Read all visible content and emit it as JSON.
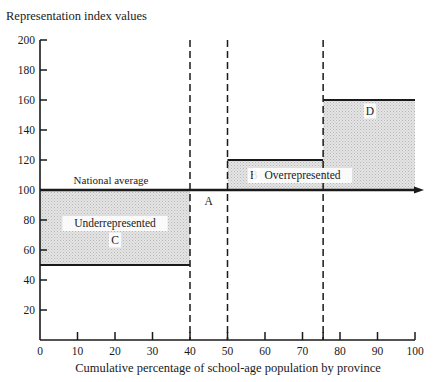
{
  "chart_data": {
    "type": "step-area",
    "title": "",
    "ylabel": "Representation index values",
    "xlabel": "Cumulative percentage of school-age population by province",
    "xlim": [
      0,
      100
    ],
    "ylim": [
      0,
      200
    ],
    "x_ticks": [
      0,
      10,
      20,
      30,
      40,
      50,
      60,
      70,
      80,
      90,
      100
    ],
    "y_ticks": [
      20,
      40,
      60,
      80,
      100,
      120,
      140,
      160,
      180,
      200
    ],
    "grid": false,
    "reference_line": {
      "label": "National average",
      "value": 100
    },
    "series": [
      {
        "name": "Representation index",
        "segments": [
          {
            "x_start": 0,
            "x_end": 40,
            "value": 50
          },
          {
            "x_start": 40,
            "x_end": 50,
            "value": 100
          },
          {
            "x_start": 50,
            "x_end": 75.5,
            "value": 120
          },
          {
            "x_start": 75.5,
            "x_end": 100,
            "value": 160
          }
        ]
      }
    ],
    "dashed_verticals": [
      40,
      50,
      75.5
    ],
    "annotations": [
      {
        "text": "Underrepresented",
        "x": 20,
        "y": 78
      },
      {
        "text": "C",
        "x": 20,
        "y": 67
      },
      {
        "text": "A",
        "x": 45,
        "y": 93
      },
      {
        "text": "B",
        "x": 57,
        "y": 110
      },
      {
        "text": "Overrepresented",
        "x": 70,
        "y": 110
      },
      {
        "text": "D",
        "x": 88,
        "y": 153
      }
    ]
  }
}
